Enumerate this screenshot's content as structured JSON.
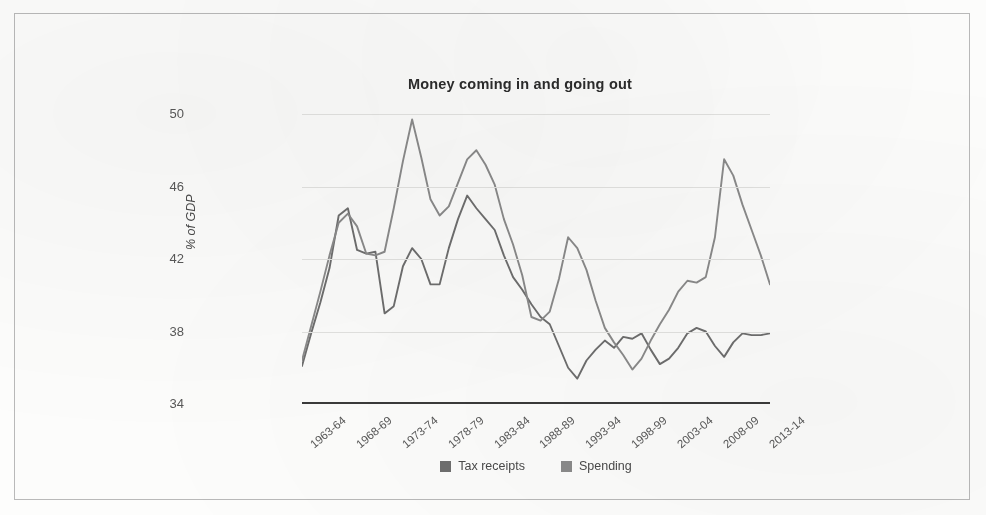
{
  "chart_data": {
    "type": "line",
    "title": "Money coming in and going out",
    "xlabel": "",
    "ylabel": "% of GDP",
    "ylim": [
      34,
      50
    ],
    "yticks": [
      34,
      38,
      42,
      46,
      50
    ],
    "grid": true,
    "legend_position": "bottom",
    "x": [
      "1963-64",
      "1964-65",
      "1965-66",
      "1966-67",
      "1967-68",
      "1968-69",
      "1969-70",
      "1970-71",
      "1971-72",
      "1972-73",
      "1973-74",
      "1974-75",
      "1975-76",
      "1976-77",
      "1977-78",
      "1978-79",
      "1979-80",
      "1980-81",
      "1981-82",
      "1982-83",
      "1983-84",
      "1984-85",
      "1985-86",
      "1986-87",
      "1987-88",
      "1988-89",
      "1989-90",
      "1990-91",
      "1991-92",
      "1992-93",
      "1993-94",
      "1994-95",
      "1995-96",
      "1996-97",
      "1997-98",
      "1998-99",
      "1999-00",
      "2000-01",
      "2001-02",
      "2002-03",
      "2003-04",
      "2004-05",
      "2005-06",
      "2006-07",
      "2007-08",
      "2008-09",
      "2009-10",
      "2010-11",
      "2011-12",
      "2012-13",
      "2013-14",
      "2014-15"
    ],
    "xtick_labels": [
      "1963-64",
      "1968-69",
      "1973-74",
      "1978-79",
      "1983-84",
      "1988-89",
      "1993-94",
      "1998-99",
      "2003-04",
      "2008-09",
      "2013-14"
    ],
    "xtick_indices": [
      0,
      5,
      10,
      15,
      20,
      25,
      30,
      35,
      40,
      45,
      50
    ],
    "series": [
      {
        "name": "Tax receipts",
        "color": "#6e6e6e",
        "values": [
          36.1,
          37.9,
          39.6,
          41.5,
          44.4,
          44.8,
          42.5,
          42.3,
          42.4,
          39.0,
          39.4,
          41.6,
          42.6,
          42.0,
          40.6,
          40.6,
          42.6,
          44.2,
          45.5,
          44.8,
          44.2,
          43.6,
          42.2,
          41.0,
          40.3,
          39.5,
          38.8,
          38.4,
          37.2,
          36.0,
          35.4,
          36.4,
          37.0,
          37.5,
          37.1,
          37.7,
          37.6,
          37.9,
          37.0,
          36.2,
          36.5,
          37.1,
          37.9,
          38.2,
          38.0,
          37.2,
          36.6,
          37.4,
          37.9,
          37.8,
          37.8,
          37.9
        ]
      },
      {
        "name": "Spending",
        "color": "#8a8a8a",
        "values": [
          36.4,
          38.3,
          40.2,
          42.2,
          44.0,
          44.5,
          43.8,
          42.3,
          42.2,
          42.4,
          44.8,
          47.4,
          49.7,
          47.6,
          45.3,
          44.4,
          44.9,
          46.2,
          47.5,
          48.0,
          47.2,
          46.1,
          44.2,
          42.8,
          41.1,
          38.8,
          38.6,
          39.1,
          40.9,
          43.2,
          42.6,
          41.4,
          39.7,
          38.2,
          37.4,
          36.7,
          35.9,
          36.5,
          37.5,
          38.4,
          39.2,
          40.2,
          40.8,
          40.7,
          41.0,
          43.2,
          47.5,
          46.6,
          45.0,
          43.6,
          42.2,
          40.6
        ]
      }
    ]
  },
  "legend": {
    "entries": [
      {
        "label": "Tax receipts",
        "color": "#6e6e6e"
      },
      {
        "label": "Spending",
        "color": "#8a8a8a"
      }
    ]
  }
}
